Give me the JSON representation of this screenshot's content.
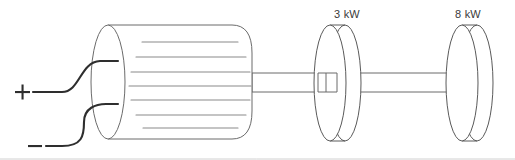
{
  "diagram": {
    "background_color": "#ffffff",
    "line_color": "#4a4a4a",
    "wire_color": "#2e2e2e",
    "winding_color": "#8a8a8a",
    "terminals": [
      {
        "id": "positive",
        "symbol": "+",
        "icon": "plus-terminal-icon",
        "x": 22,
        "y": 92,
        "wire_end_x": 118,
        "wire_end_y": 62
      },
      {
        "id": "negative",
        "symbol": "–",
        "icon": "minus-terminal-icon",
        "x": 35,
        "y": 145,
        "wire_end_x": 118,
        "wire_end_y": 104
      }
    ],
    "machine": {
      "name": "armature-cylinder",
      "left_face_cx": 108,
      "left_face_cy": 82,
      "left_face_rx": 17,
      "left_face_ry": 57,
      "body_left": 108,
      "body_right": 252,
      "winding_count": 7,
      "winding_lines": [
        {
          "x1": 142,
          "x2": 238,
          "y": 42
        },
        {
          "x1": 136,
          "x2": 246,
          "y": 57
        },
        {
          "x1": 131,
          "x2": 250,
          "y": 72
        },
        {
          "x1": 129,
          "x2": 251,
          "y": 86
        },
        {
          "x1": 131,
          "x2": 250,
          "y": 100
        },
        {
          "x1": 136,
          "x2": 246,
          "y": 115
        },
        {
          "x1": 143,
          "x2": 238,
          "y": 128
        }
      ]
    },
    "shafts": [
      {
        "name": "shaft-motor-to-disc-1",
        "x1": 252,
        "x2": 330,
        "y_top": 73,
        "y_bottom": 92
      },
      {
        "name": "shaft-disc-1-to-disc-2",
        "x1": 345,
        "x2": 462,
        "y_top": 73,
        "y_bottom": 92
      }
    ],
    "discs": [
      {
        "id": "disc-1",
        "label": "3 kW",
        "power_value": 3,
        "power_unit": "kW",
        "label_x": 347,
        "label_y": 8,
        "front_cx": 330,
        "front_cy": 83,
        "rx": 16,
        "ry": 58,
        "depth": 17
      },
      {
        "id": "disc-2",
        "label": "8 kW",
        "power_value": 8,
        "power_unit": "kW",
        "label_x": 468,
        "label_y": 8,
        "front_cx": 462,
        "front_cy": 83,
        "rx": 16,
        "ry": 58,
        "depth": 17
      }
    ],
    "baseline_rule": {
      "x1": 0,
      "x2": 515,
      "y": 159
    }
  }
}
